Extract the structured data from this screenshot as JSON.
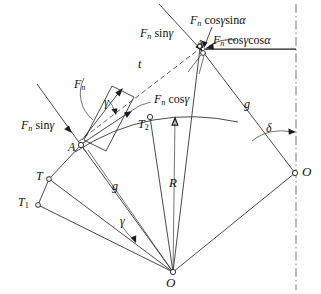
{
  "figure": {
    "kind": "force-vector-diagram",
    "background": "#fefefe",
    "ink_color": "#1c1c1c"
  },
  "labels": {
    "fn_sin_gamma_top": "Fₙ sinγ",
    "fn_cos_gamma_sin_alpha": "Fₙ cosγsinα",
    "fn_cos_gamma_cos_alpha": "Fₙ cosγcosα",
    "fn": "Fₙ",
    "fn_sin_gamma_left": "Fₙ sinγ",
    "fn_cos_gamma": "Fₙ cosγ",
    "t": "t",
    "g_right": "g",
    "g_left": "g",
    "R": "R",
    "delta": "δ",
    "gamma_upper": "γ",
    "gamma_lower": "γ",
    "A_upper": "A",
    "A_lower": "A",
    "T": "T",
    "T1": "T₁",
    "T2": "T₂",
    "O_right": "O",
    "O_bottom": "O"
  },
  "points": {
    "A_upper": {
      "x": 200,
      "y": 48
    },
    "A_lower": {
      "x": 81,
      "y": 145
    },
    "T": {
      "x": 49,
      "y": 179
    },
    "T1": {
      "x": 38,
      "y": 205
    },
    "T2": {
      "x": 150,
      "y": 117
    },
    "O_right": {
      "x": 295,
      "y": 173
    },
    "O_bottom": {
      "x": 173,
      "y": 272
    }
  },
  "geometry": {
    "axis_line_x": 296,
    "radius_R_label_value": "R",
    "arm_g_label_value": "g"
  }
}
